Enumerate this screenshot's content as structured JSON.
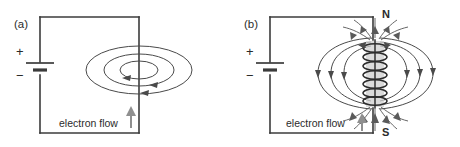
{
  "figure": {
    "background_color": "#ffffff",
    "line_color": "#3b3b3b",
    "field_line_color": "#4a4a4a",
    "flow_arrow_color": "#8f8f8f"
  },
  "panels": [
    {
      "id": "a",
      "label": "(a)",
      "subject": "straight-current-carrying-wire",
      "battery": {
        "positive_sign": "+",
        "negative_sign": "−"
      },
      "flow": {
        "label": "electron flow",
        "direction": "upward"
      },
      "field": {
        "type": "concentric-ellipses",
        "count": 3,
        "arrow_direction": "leftward-on-near-side"
      }
    },
    {
      "id": "b",
      "label": "(b)",
      "subject": "solenoid-electromagnet",
      "battery": {
        "positive_sign": "+",
        "negative_sign": "−"
      },
      "flow": {
        "label": "electron flow",
        "direction": "upward"
      },
      "poles": {
        "north": "N",
        "south": "S"
      },
      "coil": {
        "turns": 7
      },
      "field": {
        "type": "dipole-loops",
        "loops_per_side": 3,
        "arrow_direction": "north-to-south-outside"
      }
    }
  ]
}
